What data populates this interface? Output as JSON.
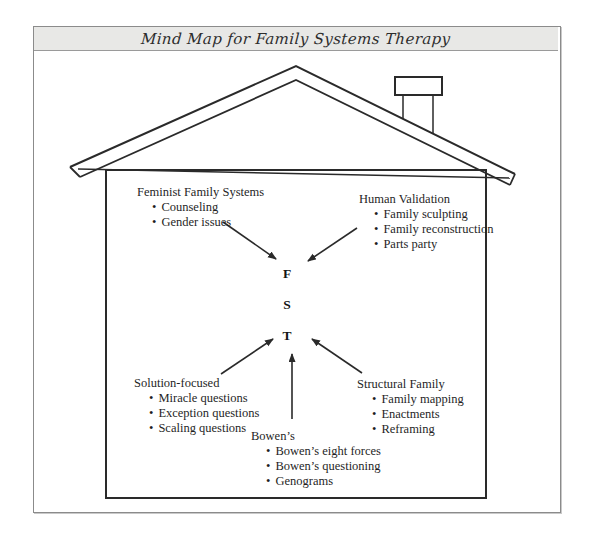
{
  "title": "Mind Map for Family Systems Therapy",
  "colors": {
    "title_band_bg": "#e8e8e6",
    "ink": "#1f1f1f",
    "line": "#2a2a2a",
    "frame_border": "#8b8b8b"
  },
  "center": {
    "letters": [
      "F",
      "S",
      "T"
    ]
  },
  "notes": {
    "feminist": {
      "title": "Feminist Family Systems",
      "items": [
        "Counseling",
        "Gender issues"
      ]
    },
    "human": {
      "title": "Human Validation",
      "items": [
        "Family sculpting",
        "Family reconstruction",
        "Parts party"
      ]
    },
    "solution": {
      "title": "Solution-focused",
      "items": [
        "Miracle questions",
        "Exception questions",
        "Scaling questions"
      ]
    },
    "bowens": {
      "title": "Bowen’s",
      "items": [
        "Bowen’s eight forces",
        "Bowen’s questioning",
        "Genograms"
      ]
    },
    "structural": {
      "title": "Structural Family",
      "items": [
        "Family mapping",
        "Enactments",
        "Reframing"
      ]
    }
  }
}
